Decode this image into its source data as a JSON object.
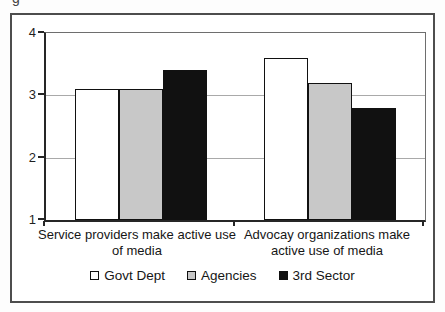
{
  "caption_fragment": "g",
  "chart_data": {
    "type": "bar",
    "title": "",
    "categories": [
      "Service providers make active use of media",
      "Advocay organizations make active use of media"
    ],
    "series": [
      {
        "name": "Govt Dept",
        "color": "#ffffff",
        "values": [
          3.1,
          3.6
        ]
      },
      {
        "name": "Agencies",
        "color": "#c8c8c8",
        "values": [
          3.1,
          3.2
        ]
      },
      {
        "name": "3rd Sector",
        "color": "#111111",
        "values": [
          3.4,
          2.8
        ]
      }
    ],
    "xlabel": "",
    "ylabel": "",
    "ylim": [
      1,
      4
    ],
    "yticks": [
      1,
      2,
      3,
      4
    ],
    "grid": true,
    "legend_position": "bottom"
  },
  "colors": {
    "frame_border": "#4d4d4d",
    "axis": "#262626",
    "gridline": "#a9a9a9",
    "text": "#1f1f1f"
  }
}
